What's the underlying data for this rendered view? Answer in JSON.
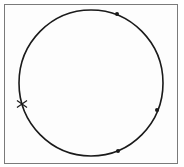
{
  "diagram": {
    "type": "circle-with-points",
    "frame": {
      "x": 4,
      "y": 4,
      "width": 174,
      "height": 160,
      "stroke": "#7a7a7a"
    },
    "circle": {
      "cx": 91,
      "cy": 83,
      "rx": 72,
      "ry": 73,
      "stroke": "#1a1a1a",
      "stroke_width": 1.6
    },
    "points": [
      {
        "label": "",
        "x": 117,
        "y": 14,
        "shape": "dot"
      },
      {
        "label": "",
        "x": 157,
        "y": 110,
        "shape": "dot"
      },
      {
        "label": "",
        "x": 118,
        "y": 151,
        "shape": "dot"
      }
    ],
    "cross_marker": {
      "x": 22,
      "y": 104,
      "size": 5
    },
    "colors": {
      "ink": "#1a1a1a",
      "border": "#7a7a7a",
      "background": "#ffffff"
    }
  }
}
